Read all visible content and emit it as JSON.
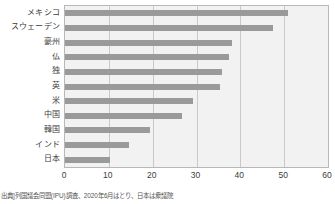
{
  "chart_data": {
    "type": "bar",
    "orientation": "horizontal",
    "title": "",
    "xlabel": "",
    "ylabel": "",
    "categories": [
      "メキシコ",
      "スウェーデン",
      "豪州",
      "仏",
      "独",
      "英",
      "米",
      "中国",
      "韓国",
      "インド",
      "日本"
    ],
    "values": [
      50.8,
      47.4,
      38.2,
      37.5,
      35.9,
      35.4,
      29.2,
      26.7,
      19.3,
      14.7,
      10.3
    ],
    "xlim": [
      0,
      60
    ],
    "xticks": [
      0,
      10,
      20,
      30,
      40,
      50,
      60
    ],
    "xtick_labels": [
      "0",
      "10",
      "20",
      "30",
      "40",
      "50",
      "60"
    ],
    "grid": true,
    "grid_axis": "x",
    "legend": false,
    "bar_color": "#9a9a9a",
    "plot_background": "#f2f2f2",
    "gridline_color": "#c9c9c9",
    "border_color": "#b8b8b8"
  },
  "source_note": "出典]列国議会同盟(IPU)調査、2020年6月はとり、日本は衆議院"
}
